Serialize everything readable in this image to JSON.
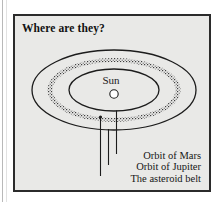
{
  "figure": {
    "title": "Where are they?",
    "background_color": "#e9e9e7",
    "border_color": "#2b2b2b",
    "center_body": {
      "label": "Sun",
      "fill_color": "#ffffff",
      "stroke_color": "#1c1c1c"
    },
    "orbits": [
      {
        "name": "orbit-of-mars",
        "label": "Orbit of Mars",
        "style": "solid-ellipse",
        "stroke_color": "#1c1c1c",
        "rx": 45,
        "ry": 21
      },
      {
        "name": "asteroid-belt",
        "label": "The asteroid belt",
        "style": "stippled-band",
        "stroke_color": "#4a4a4a",
        "rx": 64,
        "ry": 30
      },
      {
        "name": "orbit-of-jupiter",
        "label": "Orbit of Jupiter",
        "style": "solid-ellipse",
        "stroke_color": "#1c1c1c",
        "rx": 82,
        "ry": 40
      }
    ],
    "callouts": [
      {
        "name": "callout-orbit-of-mars",
        "label": "Orbit of Mars"
      },
      {
        "name": "callout-orbit-of-jupiter",
        "label": "Orbit of Jupiter"
      },
      {
        "name": "callout-asteroid-belt",
        "label": "The asteroid belt"
      }
    ]
  }
}
